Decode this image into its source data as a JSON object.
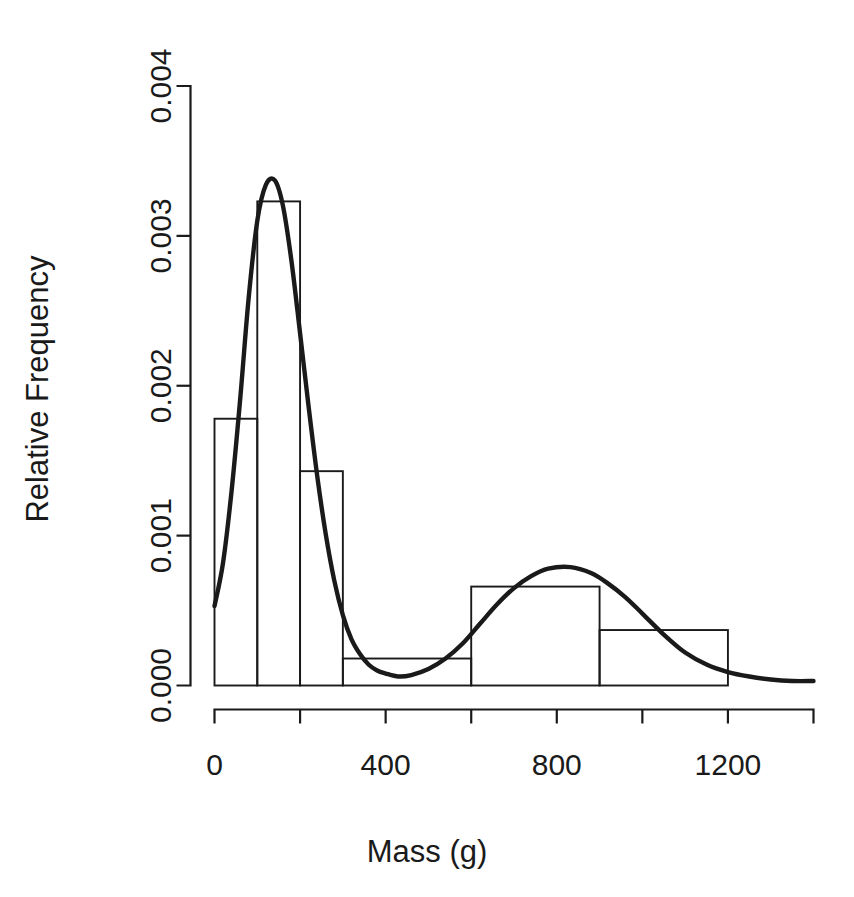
{
  "chart_data": {
    "type": "bar",
    "title": "",
    "subtitle": "",
    "xlabel": "Mass (g)",
    "ylabel": "Relative Frequency",
    "xlim": [
      0,
      1400
    ],
    "ylim": [
      0,
      0.004
    ],
    "grid": false,
    "legend": null,
    "x_ticks": [
      0,
      200,
      400,
      600,
      800,
      1000,
      1200,
      1400
    ],
    "x_tick_labels": [
      "0",
      "",
      "400",
      "",
      "800",
      "",
      "1200",
      ""
    ],
    "y_ticks": [
      0,
      0.001,
      0.002,
      0.003,
      0.004
    ],
    "y_tick_labels": [
      "0.000",
      "0.001",
      "0.002",
      "0.003",
      "0.004"
    ],
    "bins": [
      {
        "start": 0,
        "end": 100,
        "value": 0.00178
      },
      {
        "start": 100,
        "end": 200,
        "value": 0.00323
      },
      {
        "start": 200,
        "end": 300,
        "value": 0.00143
      },
      {
        "start": 300,
        "end": 600,
        "value": 0.00018
      },
      {
        "start": 600,
        "end": 900,
        "value": 0.00066
      },
      {
        "start": 900,
        "end": 1200,
        "value": 0.00037
      }
    ],
    "series": [
      {
        "name": "density",
        "type": "line",
        "x": [
          0,
          20,
          40,
          60,
          80,
          100,
          120,
          141,
          160,
          180,
          200,
          220,
          240,
          260,
          280,
          300,
          320,
          340,
          360,
          380,
          400,
          430,
          460,
          500,
          540,
          580,
          620,
          660,
          700,
          740,
          780,
          832,
          880,
          920,
          960,
          1000,
          1050,
          1100,
          1150,
          1200,
          1250,
          1300,
          1350,
          1400
        ],
        "values": [
          0.00053,
          0.00082,
          0.0013,
          0.00191,
          0.00259,
          0.0031,
          0.00334,
          0.00337,
          0.0032,
          0.00283,
          0.00235,
          0.00186,
          0.0014,
          0.00101,
          0.0007,
          0.00047,
          0.00031,
          0.00021,
          0.00014,
          0.0001,
          8e-05,
          6e-05,
          7e-05,
          0.00011,
          0.00018,
          0.00028,
          0.00041,
          0.00054,
          0.00065,
          0.00073,
          0.00078,
          0.00079,
          0.00075,
          0.00068,
          0.00059,
          0.00048,
          0.00034,
          0.00022,
          0.00014,
          9e-05,
          6e-05,
          4e-05,
          3e-05,
          3e-05
        ]
      }
    ],
    "colors": {
      "axis": "#1a1a1a",
      "bar_stroke": "#1a1a1a",
      "curve": "#1a1a1a",
      "background": "#ffffff"
    }
  }
}
